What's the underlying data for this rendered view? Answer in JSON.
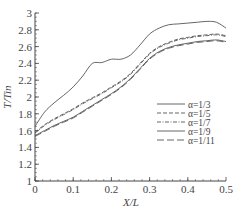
{
  "chart_data": {
    "type": "line",
    "title": "",
    "xlabel": "X/L",
    "ylabel": "T/Tin",
    "xlim": [
      0,
      0.5
    ],
    "ylim": [
      1,
      3
    ],
    "grid": false,
    "legend_position": "center-right inside",
    "x_ticks": [
      "0",
      "0.1",
      "0.2",
      "0.3",
      "0.4",
      "0.5"
    ],
    "y_ticks": [
      "1",
      "1.2",
      "1.4",
      "1.6",
      "1.8",
      "2",
      "2.2",
      "2.4",
      "2.6",
      "2.8",
      "3"
    ],
    "x": [
      0,
      0.025,
      0.05,
      0.075,
      0.1,
      0.125,
      0.15,
      0.175,
      0.2,
      0.225,
      0.25,
      0.275,
      0.3,
      0.325,
      0.35,
      0.375,
      0.4,
      0.425,
      0.45,
      0.475,
      0.5
    ],
    "series": [
      {
        "name": "α=1/3",
        "style": "solid",
        "values": [
          1.65,
          1.82,
          1.93,
          2.02,
          2.12,
          2.25,
          2.4,
          2.41,
          2.45,
          2.45,
          2.5,
          2.62,
          2.75,
          2.82,
          2.86,
          2.87,
          2.88,
          2.89,
          2.9,
          2.89,
          2.82
        ]
      },
      {
        "name": "α=1/5",
        "style": "dashed",
        "values": [
          1.58,
          1.67,
          1.74,
          1.8,
          1.86,
          1.93,
          1.99,
          2.05,
          2.12,
          2.19,
          2.28,
          2.4,
          2.52,
          2.6,
          2.65,
          2.69,
          2.71,
          2.73,
          2.74,
          2.75,
          2.73
        ]
      },
      {
        "name": "α=1/7",
        "style": "dash-dot",
        "values": [
          1.57,
          1.66,
          1.73,
          1.79,
          1.85,
          1.92,
          1.98,
          2.04,
          2.11,
          2.18,
          2.27,
          2.39,
          2.51,
          2.59,
          2.64,
          2.68,
          2.7,
          2.72,
          2.73,
          2.74,
          2.72
        ]
      },
      {
        "name": "α=1/9",
        "style": "solid",
        "values": [
          1.54,
          1.6,
          1.66,
          1.71,
          1.76,
          1.83,
          1.9,
          1.97,
          2.04,
          2.12,
          2.22,
          2.34,
          2.46,
          2.54,
          2.59,
          2.62,
          2.64,
          2.66,
          2.67,
          2.68,
          2.66
        ]
      },
      {
        "name": "α=1/11",
        "style": "long-dash",
        "values": [
          1.53,
          1.59,
          1.65,
          1.7,
          1.75,
          1.82,
          1.89,
          1.96,
          2.03,
          2.11,
          2.21,
          2.33,
          2.45,
          2.53,
          2.58,
          2.61,
          2.63,
          2.65,
          2.66,
          2.67,
          2.65
        ]
      }
    ]
  },
  "labels": {
    "xlabel": "X/L",
    "ylabel": "T/Tin",
    "legend": [
      "α=1/3",
      "α=1/5",
      "α=1/7",
      "α=1/9",
      "α=1/11"
    ]
  },
  "colors": {
    "line": "#555555",
    "axis": "#444444",
    "background": "#ffffff"
  }
}
